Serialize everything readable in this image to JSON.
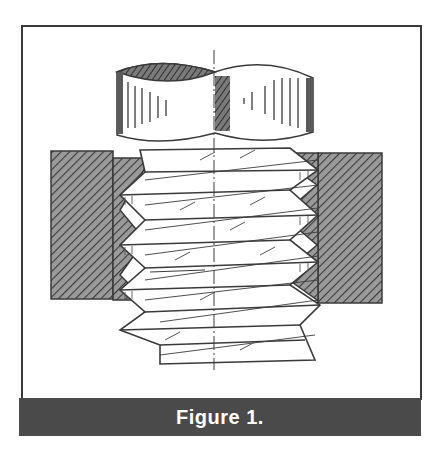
{
  "figure": {
    "caption": "Figure 1.",
    "colors": {
      "frame_border": "#3a3a3a",
      "caption_bar": "#4a4a4a",
      "caption_text": "#ffffff",
      "ink": "#3a3a3a",
      "hatch_fill": "#8a8a8a",
      "background": "#ffffff"
    }
  }
}
